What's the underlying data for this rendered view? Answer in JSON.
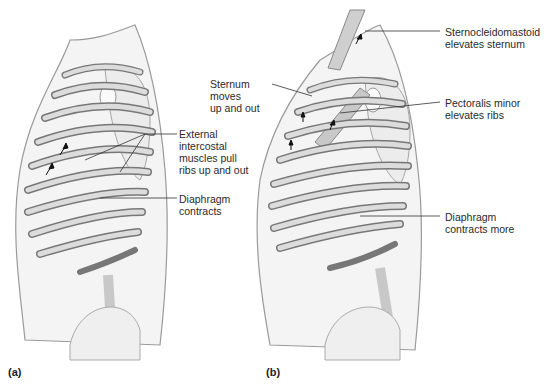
{
  "figure": {
    "panels": [
      {
        "id": "a",
        "letter": "(a)",
        "labels": {
          "external_intercostal": [
            "External",
            "intercostal",
            "muscles pull",
            "ribs up and out"
          ],
          "diaphragm": [
            "Diaphragm",
            "contracts"
          ]
        }
      },
      {
        "id": "b",
        "letter": "(b)",
        "labels": {
          "sternocleidomastoid": [
            "Sternocleidomastoid",
            "elevates sternum"
          ],
          "sternum": [
            "Sternum",
            "moves",
            "up and out"
          ],
          "pectoralis_minor": [
            "Pectoralis minor",
            "elevates ribs"
          ],
          "diaphragm": [
            "Diaphragm",
            "contracts more"
          ]
        }
      }
    ],
    "colors": {
      "body_outline": "#9a9a9a",
      "body_fill": "#f4f4f4",
      "rib_fill": "#d6d6d6",
      "rib_shadow": "#6e6e6e",
      "leader_line": "#333333"
    }
  }
}
